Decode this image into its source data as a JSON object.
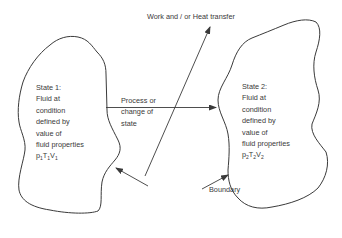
{
  "diagram": {
    "title_arrow_label": "Work and / or Heat transfer",
    "process_label": {
      "lines": [
        "Process or",
        "change of",
        "state"
      ]
    },
    "boundary_label": "Boundary",
    "state1": {
      "lines": [
        "State 1:",
        "Fluid at",
        "condition",
        "defined by",
        "value of",
        "fluid properties"
      ],
      "properties": [
        {
          "symbol": "p",
          "sub": "1"
        },
        {
          "symbol": "T",
          "sub": "1"
        },
        {
          "symbol": "V",
          "sub": "1"
        }
      ]
    },
    "state2": {
      "lines": [
        "State 2:",
        "Fluid at",
        "condition",
        "defined by",
        "value of",
        "fluid properties"
      ],
      "properties": [
        {
          "symbol": "p",
          "sub": "2"
        },
        {
          "symbol": "T",
          "sub": "2"
        },
        {
          "symbol": "V",
          "sub": "2"
        }
      ]
    },
    "colors": {
      "stroke": "#3a3a3a",
      "text": "#3a3a3a",
      "background": "#ffffff"
    }
  }
}
